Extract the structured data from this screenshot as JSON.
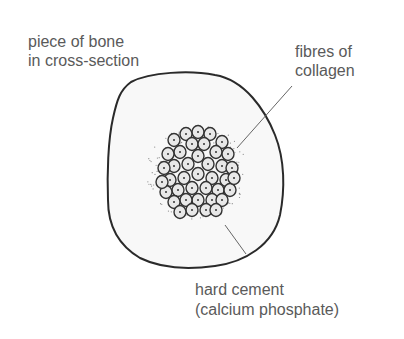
{
  "labels": {
    "bone_line1": "piece of bone",
    "bone_line2": "in cross-section",
    "collagen_line1": "fibres of",
    "collagen_line2": "collagen",
    "cement_line1": "hard cement",
    "cement_line2": "(calcium phosphate)"
  },
  "colors": {
    "outline": "#2a2a2a",
    "fill": "#f7f7f7",
    "text": "#5a5a5a"
  }
}
